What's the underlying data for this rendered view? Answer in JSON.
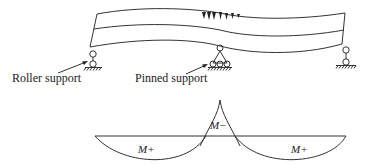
{
  "diagram": {
    "beam": {
      "label": "deflected beam",
      "load_marker_count": 7
    },
    "supports": [
      {
        "type": "roller",
        "label": "Roller support",
        "position": "left"
      },
      {
        "type": "pinned",
        "label": "Pinned support",
        "position": "middle"
      },
      {
        "type": "roller",
        "label": "",
        "position": "right"
      }
    ],
    "moment_diagram": {
      "regions": [
        {
          "label": "M+",
          "position": "left span"
        },
        {
          "label": "M−",
          "position": "middle support"
        },
        {
          "label": "M+",
          "position": "right span"
        }
      ]
    },
    "colors": {
      "line": "#333333",
      "background": "#ffffff"
    }
  }
}
